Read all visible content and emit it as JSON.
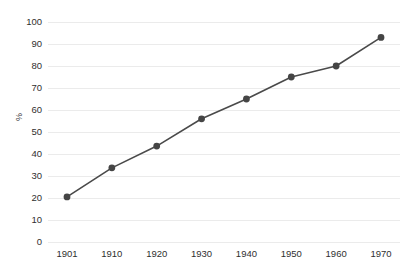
{
  "chart_data": {
    "type": "line",
    "title": "",
    "subtitle": "",
    "xlabel": "",
    "ylabel": "%",
    "categories": [
      "1901",
      "1910",
      "1920",
      "1930",
      "1940",
      "1950",
      "1960",
      "1970"
    ],
    "values": [
      20.5,
      33.7,
      43.6,
      56.0,
      65.0,
      75.0,
      80.0,
      93.0
    ],
    "series": [
      {
        "name": "%",
        "values": [
          20.5,
          33.7,
          43.6,
          56.0,
          65.0,
          75.0,
          80.0,
          93.0
        ]
      }
    ],
    "ylim": [
      0,
      100
    ],
    "ytick_labels": [
      "0",
      "10",
      "20",
      "30",
      "40",
      "50",
      "60",
      "70",
      "80",
      "90",
      "100"
    ],
    "ytick_values": [
      0,
      10,
      20,
      30,
      40,
      50,
      60,
      70,
      80,
      90,
      100
    ],
    "xtick_labels": [
      "1901",
      "1910",
      "1920",
      "1930",
      "1940",
      "1950",
      "1960",
      "1970"
    ],
    "grid": true,
    "grid_axis": "y",
    "legend": false,
    "legend_position": "none",
    "marker": "circle",
    "colors": {
      "line": "#4a4a4a",
      "marker": "#454545",
      "grid": "#ebebeb",
      "axis_text": "#2f2f2f",
      "background": "#ffffff"
    }
  }
}
